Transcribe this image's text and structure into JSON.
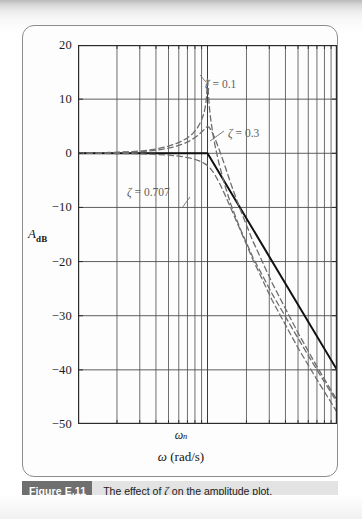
{
  "figure": {
    "caption_badge": "Figure E.11",
    "caption_text_pre": "The effect of ",
    "caption_zeta": "ζ",
    "caption_text_post": " on the amplitude plot."
  },
  "axes": {
    "y_label_main": "A",
    "y_label_sub": "dB",
    "x_label": "ω (rad/s)",
    "x_label_italic": "ω",
    "x_label_rest": " (rad/s)",
    "corner_marker": "ω",
    "corner_marker_sub": "n"
  },
  "annotations": [
    {
      "id": "zeta-0p1",
      "text": "ζ = 0.1",
      "zeta": "ζ",
      "value": "= 0.1",
      "x": 205,
      "y": 78
    },
    {
      "id": "zeta-0p3",
      "text": "ζ = 0.3",
      "zeta": "ζ",
      "value": "= 0.3",
      "x": 228,
      "y": 127
    },
    {
      "id": "zeta-0p707",
      "text": "ζ = 0.707",
      "zeta": "ζ",
      "value": "= 0.707",
      "x": 127,
      "y": 186
    }
  ],
  "chart_data": {
    "type": "line",
    "title": "The effect of ζ on the amplitude plot.",
    "xlabel": "ω (rad/s)",
    "ylabel": "A_dB",
    "xscale": "log",
    "xlim_decades": [
      -1.0,
      1.0
    ],
    "x_normalized_note": "frequency axis is ω/ωn, spanning 0.1 to 10 (two decades); ωn marked at center",
    "ylim": [
      -50,
      20
    ],
    "ytick_values": [
      20,
      10,
      0,
      -10,
      -20,
      -30,
      -40,
      -50
    ],
    "ytick_labels": [
      "20",
      "10",
      "0",
      "−10",
      "−20",
      "−30",
      "−40",
      "−50"
    ],
    "ymajor_gridlines": [
      20,
      10,
      0,
      -10,
      -20,
      -30,
      -40,
      -50
    ],
    "xgrid_decade_minors": [
      1,
      2,
      3,
      4,
      5,
      6,
      7,
      8,
      9
    ],
    "grid": true,
    "legend_position": "inline-annotations",
    "corner_frequency_ratio": 1.0,
    "series": [
      {
        "name": "asymptotic approximation",
        "style": "solid",
        "color": "#111111",
        "width": 2.0,
        "points_log_db": [
          [
            -1.0,
            0
          ],
          [
            0.0,
            0
          ],
          [
            1.0,
            -40
          ]
        ],
        "note": "0 dB until ωn then −40 dB/decade"
      },
      {
        "name": "ζ = 0.1",
        "zeta": 0.1,
        "style": "dashed",
        "color": "#6e6e6e",
        "width": 1.3,
        "peak_db": 14.0,
        "points_log_db": [
          [
            -1.0,
            0.04
          ],
          [
            -0.8,
            0.11
          ],
          [
            -0.6,
            0.28
          ],
          [
            -0.5,
            0.46
          ],
          [
            -0.4,
            0.77
          ],
          [
            -0.3,
            1.31
          ],
          [
            -0.22,
            2.0
          ],
          [
            -0.16,
            2.75
          ],
          [
            -0.12,
            3.5
          ],
          [
            -0.08,
            4.6
          ],
          [
            -0.05,
            5.9
          ],
          [
            -0.03,
            7.2
          ],
          [
            -0.02,
            8.2
          ],
          [
            -0.012,
            9.4
          ],
          [
            -0.006,
            11.0
          ],
          [
            -0.002,
            12.9
          ],
          [
            0.0,
            13.98
          ],
          [
            0.003,
            12.7
          ],
          [
            0.008,
            10.6
          ],
          [
            0.015,
            8.4
          ],
          [
            0.025,
            6.2
          ],
          [
            0.04,
            3.8
          ],
          [
            0.06,
            1.2
          ],
          [
            0.09,
            -2.0
          ],
          [
            0.13,
            -5.6
          ],
          [
            0.18,
            -9.4
          ],
          [
            0.25,
            -13.8
          ],
          [
            0.35,
            -19.2
          ],
          [
            0.5,
            -26.0
          ],
          [
            0.7,
            -34.2
          ],
          [
            0.85,
            -40.2
          ],
          [
            1.0,
            -46.0
          ]
        ]
      },
      {
        "name": "ζ = 0.3",
        "zeta": 0.3,
        "style": "dashed",
        "color": "#6e6e6e",
        "width": 1.3,
        "peak_db": 5.0,
        "points_log_db": [
          [
            -1.0,
            0.02
          ],
          [
            -0.8,
            0.07
          ],
          [
            -0.6,
            0.2
          ],
          [
            -0.5,
            0.33
          ],
          [
            -0.4,
            0.55
          ],
          [
            -0.3,
            0.95
          ],
          [
            -0.24,
            1.3
          ],
          [
            -0.18,
            1.8
          ],
          [
            -0.14,
            2.25
          ],
          [
            -0.1,
            2.85
          ],
          [
            -0.07,
            3.4
          ],
          [
            -0.05,
            3.85
          ],
          [
            -0.03,
            4.3
          ],
          [
            -0.02,
            4.55
          ],
          [
            -0.01,
            4.8
          ],
          [
            0.0,
            4.95
          ],
          [
            0.01,
            4.85
          ],
          [
            0.02,
            4.55
          ],
          [
            0.04,
            3.7
          ],
          [
            0.06,
            2.6
          ],
          [
            0.09,
            0.7
          ],
          [
            0.13,
            -2.0
          ],
          [
            0.18,
            -5.6
          ],
          [
            0.25,
            -10.2
          ],
          [
            0.35,
            -16.2
          ],
          [
            0.5,
            -24.0
          ],
          [
            0.7,
            -33.2
          ],
          [
            0.85,
            -39.6
          ],
          [
            1.0,
            -45.6
          ]
        ]
      },
      {
        "name": "ζ = 0.707",
        "zeta": 0.707,
        "style": "dashed",
        "color": "#6e6e6e",
        "width": 1.3,
        "peak_db": 0.0,
        "points_log_db": [
          [
            -1.0,
            -0.01
          ],
          [
            -0.8,
            -0.03
          ],
          [
            -0.6,
            -0.07
          ],
          [
            -0.5,
            -0.12
          ],
          [
            -0.4,
            -0.2
          ],
          [
            -0.3,
            -0.34
          ],
          [
            -0.24,
            -0.48
          ],
          [
            -0.18,
            -0.68
          ],
          [
            -0.14,
            -0.86
          ],
          [
            -0.1,
            -1.1
          ],
          [
            -0.07,
            -1.35
          ],
          [
            -0.05,
            -1.55
          ],
          [
            -0.03,
            -1.8
          ],
          [
            -0.02,
            -1.95
          ],
          [
            -0.01,
            -2.1
          ],
          [
            0.0,
            -2.3
          ],
          [
            0.02,
            -2.75
          ],
          [
            0.04,
            -3.35
          ],
          [
            0.06,
            -4.1
          ],
          [
            0.09,
            -5.4
          ],
          [
            0.13,
            -7.4
          ],
          [
            0.18,
            -10.1
          ],
          [
            0.25,
            -14.0
          ],
          [
            0.35,
            -19.6
          ],
          [
            0.5,
            -27.2
          ],
          [
            0.7,
            -36.0
          ],
          [
            0.85,
            -42.0
          ],
          [
            1.0,
            -47.8
          ]
        ]
      }
    ]
  }
}
